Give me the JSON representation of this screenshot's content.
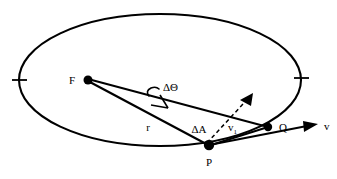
{
  "figure": {
    "type": "geometry-diagram",
    "background_color": "#ffffff",
    "stroke_color": "#000000"
  },
  "labels": {
    "focus": "F",
    "point_p": "P",
    "point_q": "Q",
    "radius": "r",
    "delta_theta": "ΔΘ",
    "delta_area": "ΔA",
    "velocity": "v",
    "velocity_component": "v",
    "velocity_component_subscript": "1"
  },
  "geometry": {
    "ellipse": {
      "center_x": 160,
      "center_y": 80,
      "radius_x": 141,
      "radius_y": 66
    },
    "focus_point": {
      "x": 87,
      "y": 80,
      "dot_radius": 4
    },
    "point_p": {
      "x": 208,
      "y": 145,
      "dot_radius": 5
    },
    "point_q": {
      "x": 268,
      "y": 127,
      "dot_radius": 4
    },
    "velocity_arrow_tip": {
      "x": 318,
      "y": 124
    },
    "component_arrow_tip": {
      "x": 249,
      "y": 99
    },
    "axis_tick_left": {
      "x": 19,
      "y": 80
    },
    "axis_tick_right": {
      "x": 301,
      "y": 78
    }
  },
  "elements": [
    {
      "name": "orbit-ellipse",
      "kind": "ellipse"
    },
    {
      "name": "radius-line-fp",
      "kind": "line",
      "from": "F",
      "to": "P"
    },
    {
      "name": "radius-line-fq",
      "kind": "line",
      "from": "F",
      "to": "Q"
    },
    {
      "name": "chord-line-pq",
      "kind": "line",
      "from": "P",
      "to": "Q"
    },
    {
      "name": "velocity-vector",
      "kind": "arrow",
      "label": "v"
    },
    {
      "name": "velocity-component-vector",
      "kind": "arrow",
      "label": "v1"
    },
    {
      "name": "angle-arc",
      "kind": "arc",
      "label": "ΔΘ"
    },
    {
      "name": "perpendicular-tick",
      "kind": "tick"
    },
    {
      "name": "axis-tick-left",
      "kind": "tick"
    },
    {
      "name": "axis-tick-right",
      "kind": "tick"
    }
  ]
}
